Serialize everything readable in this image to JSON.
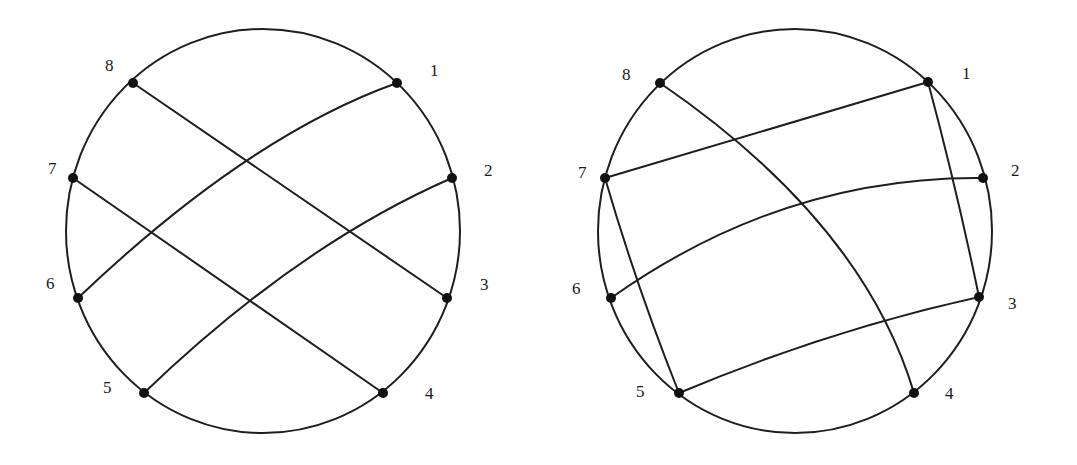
{
  "figures": [
    {
      "name": "left-chord-diagram",
      "circle": {
        "cx": 263,
        "cy": 231,
        "rx": 197,
        "ry": 202
      },
      "points": [
        {
          "label": "1",
          "x": 397,
          "y": 83,
          "lx": 430,
          "ly": 76
        },
        {
          "label": "2",
          "x": 452,
          "y": 178,
          "lx": 484,
          "ly": 176
        },
        {
          "label": "3",
          "x": 447,
          "y": 298,
          "lx": 480,
          "ly": 290
        },
        {
          "label": "4",
          "x": 383,
          "y": 393,
          "lx": 425,
          "ly": 399
        },
        {
          "label": "5",
          "x": 144,
          "y": 393,
          "lx": 103,
          "ly": 393
        },
        {
          "label": "6",
          "x": 78,
          "y": 298,
          "lx": 46,
          "ly": 289
        },
        {
          "label": "7",
          "x": 73,
          "y": 178,
          "lx": 48,
          "ly": 174
        },
        {
          "label": "8",
          "x": 133,
          "y": 83,
          "lx": 105,
          "ly": 71
        }
      ],
      "chords": [
        {
          "from": "8",
          "to": "3",
          "d": "M133,83 L447,298"
        },
        {
          "from": "7",
          "to": "4",
          "d": "M73,178 L383,393"
        },
        {
          "from": "1",
          "to": "6",
          "d": "M397,83 Q248,136 78,298"
        },
        {
          "from": "2",
          "to": "5",
          "d": "M452,178 Q298,245 144,393"
        }
      ]
    },
    {
      "name": "right-chord-diagram",
      "circle": {
        "cx": 795,
        "cy": 231,
        "rx": 197,
        "ry": 202
      },
      "points": [
        {
          "label": "1",
          "x": 928,
          "y": 82,
          "lx": 962,
          "ly": 79
        },
        {
          "label": "2",
          "x": 983,
          "y": 178,
          "lx": 1011,
          "ly": 176
        },
        {
          "label": "3",
          "x": 979,
          "y": 297,
          "lx": 1008,
          "ly": 309
        },
        {
          "label": "4",
          "x": 914,
          "y": 393,
          "lx": 945,
          "ly": 399
        },
        {
          "label": "5",
          "x": 679,
          "y": 393,
          "lx": 636,
          "ly": 397
        },
        {
          "label": "6",
          "x": 611,
          "y": 298,
          "lx": 572,
          "ly": 294
        },
        {
          "label": "7",
          "x": 605,
          "y": 178,
          "lx": 578,
          "ly": 178
        },
        {
          "label": "8",
          "x": 660,
          "y": 83,
          "lx": 622,
          "ly": 80
        }
      ],
      "chords": [
        {
          "from": "1",
          "to": "7",
          "d": "M928,82 L605,178"
        },
        {
          "from": "1",
          "to": "3",
          "d": "M928,82 Q957,190 979,297"
        },
        {
          "from": "7",
          "to": "5",
          "d": "M605,178 Q637,288 679,393"
        },
        {
          "from": "8",
          "to": "4",
          "d": "M660,83 Q863,222 914,393"
        },
        {
          "from": "2",
          "to": "6",
          "d": "M983,178 Q783,176 611,298"
        },
        {
          "from": "3",
          "to": "5",
          "d": "M979,297 Q829,330 679,393"
        }
      ]
    }
  ]
}
